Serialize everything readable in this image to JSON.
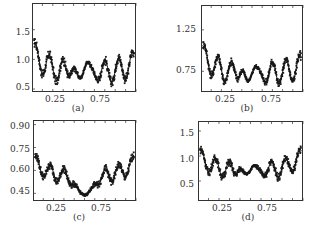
{
  "figure": {
    "layout": "2x2 grid of line/scatter plots"
  },
  "chart_data": [
    {
      "id": "a",
      "type": "scatter",
      "caption": "(a)",
      "title": "",
      "xlabel": "",
      "ylabel": "",
      "xlim": [
        0.0,
        1.0
      ],
      "ylim": [
        0.45,
        1.95
      ],
      "xticks": [
        0.25,
        0.75
      ],
      "xtick_labels": [
        "0.25",
        "0.75"
      ],
      "yticks": [
        0.5,
        1.0,
        1.5
      ],
      "ytick_labels": [
        "0.5",
        "1.0",
        "1.5"
      ],
      "grid": false,
      "legend": null,
      "description": "U-shaped oscillating dense scatter; rises sharply near x=0 (~1.9) and x=1 (~1.3); central oscillations between ~0.5 and ~0.95",
      "shape": {
        "edge_left": 1.9,
        "edge_right": 1.35,
        "base": 0.78,
        "amp": 0.2,
        "center_amp": 0.15,
        "center_base": 0.82,
        "band": 0.12
      }
    },
    {
      "id": "b",
      "type": "scatter",
      "caption": "(b)",
      "title": "",
      "xlabel": "",
      "ylabel": "",
      "xlim": [
        0.0,
        1.0
      ],
      "ylim": [
        0.5,
        1.55
      ],
      "xticks": [
        0.25,
        0.75
      ],
      "xtick_labels": [
        "0.25",
        "0.75"
      ],
      "yticks": [
        0.75,
        1.25
      ],
      "ytick_labels": [
        "0.75",
        "1.25"
      ],
      "grid": false,
      "legend": null,
      "description": "U-shaped oscillating dense scatter; peaks ~1.5 at x=0, ~1.0 at x=1; central oscillations between ~0.55 and ~0.85",
      "shape": {
        "edge_left": 1.5,
        "edge_right": 1.05,
        "base": 0.72,
        "amp": 0.14,
        "center_amp": 0.1,
        "center_base": 0.72,
        "band": 0.08
      }
    },
    {
      "id": "c",
      "type": "scatter",
      "caption": "(c)",
      "title": "",
      "xlabel": "",
      "ylabel": "",
      "xlim": [
        0.0,
        1.0
      ],
      "ylim": [
        0.4,
        0.93
      ],
      "xticks": [
        0.25,
        0.75
      ],
      "xtick_labels": [
        "0.25",
        "0.75"
      ],
      "yticks": [
        0.45,
        0.6,
        0.75,
        0.9
      ],
      "ytick_labels": [
        "0.45",
        "0.60",
        "0.75",
        "0.90"
      ],
      "grid": false,
      "legend": null,
      "description": "U-shaped oscillating dense scatter; peaks ~0.87 at both ends; broad minimum ~0.43 around x=0.5",
      "shape": {
        "edge_left": 0.87,
        "edge_right": 0.87,
        "base": 0.56,
        "amp": 0.05,
        "center_amp": 0.0,
        "center_base": 0.44,
        "band": 0.04
      }
    },
    {
      "id": "d",
      "type": "scatter",
      "caption": "(d)",
      "title": "",
      "xlabel": "",
      "ylabel": "",
      "xlim": [
        0.0,
        1.0
      ],
      "ylim": [
        0.1,
        1.7
      ],
      "xticks": [
        0.25,
        0.75
      ],
      "xtick_labels": [
        "0.25",
        "0.75"
      ],
      "yticks": [
        0.5,
        1.0,
        1.5
      ],
      "ytick_labels": [
        "0.5",
        "1.0",
        "1.5"
      ],
      "grid": false,
      "legend": null,
      "description": "U-shaped oscillating dense scatter; peaks ~1.65 at both ends, dropping to ~0.2 at extreme edges; central oscillations between ~0.5 and ~0.85",
      "shape": {
        "edge_left": 1.65,
        "edge_right": 1.65,
        "base": 0.7,
        "amp": 0.17,
        "center_amp": 0.1,
        "center_base": 0.72,
        "band": 0.12
      }
    }
  ]
}
